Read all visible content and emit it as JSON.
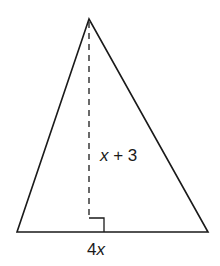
{
  "figure": {
    "shape": "triangle",
    "height_label": {
      "var": "x",
      "rest": " + 3"
    },
    "base_label": {
      "coef": "4",
      "var": "x"
    },
    "right_angle_marker": true,
    "height_line_style": "dashed",
    "stroke_color": "#1a1a1a",
    "background": "#ffffff"
  }
}
